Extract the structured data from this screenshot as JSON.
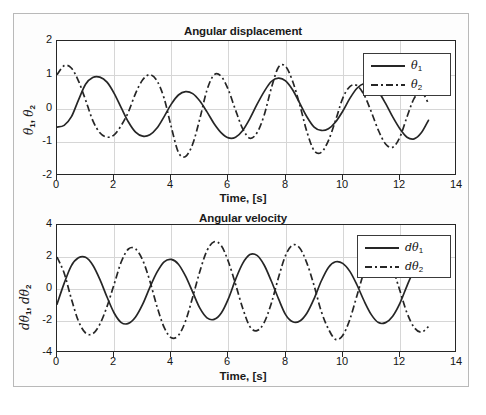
{
  "figure": {
    "width": 486,
    "height": 415,
    "background": "#ffffff",
    "frame_color": "#b9b9b9"
  },
  "style": {
    "line_color": "#262626",
    "grid_color": "#d6d6d6",
    "axis_color": "#262626",
    "text_color": "#151515"
  },
  "subplots": [
    {
      "name": "angular-displacement",
      "title": "Angular displacement",
      "xlabel": "Time, [s]",
      "ylabel_parts": {
        "a": "θ",
        "a_sub": "1",
        "sep": ", ",
        "b": "θ",
        "b_sub": "2"
      },
      "xticks": [
        "0",
        "2",
        "4",
        "6",
        "8",
        "10",
        "12",
        "14"
      ],
      "yticks": [
        "2",
        "1",
        "0",
        "-1",
        "-2"
      ],
      "legend": [
        {
          "label_base": "θ",
          "label_sub": "1",
          "style": "solid"
        },
        {
          "label_base": "θ",
          "label_sub": "2",
          "style": "dashdot"
        }
      ]
    },
    {
      "name": "angular-velocity",
      "title": "Angular velocity",
      "xlabel": "Time, [s]",
      "ylabel_parts": {
        "a": "dθ",
        "a_sub": "1",
        "sep": ", ",
        "b": "dθ",
        "b_sub": "2"
      },
      "xticks": [
        "0",
        "2",
        "4",
        "6",
        "8",
        "10",
        "12",
        "14"
      ],
      "yticks": [
        "4",
        "2",
        "0",
        "-2",
        "-4"
      ],
      "legend": [
        {
          "label_base": "dθ",
          "label_sub": "1",
          "style": "solid"
        },
        {
          "label_base": "dθ",
          "label_sub": "2",
          "style": "dashdot"
        }
      ]
    }
  ],
  "chart_data": [
    {
      "type": "line",
      "title": "Angular displacement",
      "xlabel": "Time, [s]",
      "ylabel": "theta_1, theta_2",
      "xlim": [
        0,
        14
      ],
      "ylim": [
        -2,
        2
      ],
      "xticks": [
        0,
        2,
        4,
        6,
        8,
        10,
        12,
        14
      ],
      "yticks": [
        -2,
        -1,
        0,
        1,
        2
      ],
      "grid": true,
      "legend_position": "top-right",
      "data_extent_x": [
        0,
        13
      ],
      "model": "coupled double pendulum, beating normal modes",
      "series": [
        {
          "name": "theta_1",
          "style": "solid",
          "color": "#262626",
          "description": "slow-envelope beating oscillation starting near -0.55 rad",
          "x": [
            0,
            0.25,
            0.5,
            0.75,
            1,
            1.25,
            1.5,
            1.75,
            2,
            2.25,
            2.5,
            2.75,
            3,
            3.25,
            3.5,
            3.75,
            4,
            4.25,
            4.5,
            4.75,
            5,
            5.25,
            5.5,
            5.75,
            6,
            6.25,
            6.5,
            6.75,
            7,
            7.25,
            7.5,
            7.75,
            8,
            8.25,
            8.5,
            8.75,
            9,
            9.25,
            9.5,
            9.75,
            10,
            10.25,
            10.5,
            10.75,
            11,
            11.25,
            11.5,
            11.75,
            12,
            12.25,
            12.5,
            12.75,
            13
          ],
          "y": [
            -0.55,
            -0.5,
            -0.25,
            0.25,
            0.72,
            0.92,
            0.93,
            0.78,
            0.45,
            0.02,
            -0.4,
            -0.7,
            -0.82,
            -0.78,
            -0.58,
            -0.24,
            0.13,
            0.4,
            0.5,
            0.44,
            0.22,
            -0.1,
            -0.45,
            -0.72,
            -0.87,
            -0.85,
            -0.65,
            -0.3,
            0.12,
            0.5,
            0.8,
            0.9,
            0.82,
            0.55,
            0.15,
            -0.25,
            -0.55,
            -0.65,
            -0.6,
            -0.4,
            -0.08,
            0.3,
            0.6,
            0.74,
            0.7,
            0.5,
            0.15,
            -0.25,
            -0.6,
            -0.85,
            -0.9,
            -0.72,
            -0.35
          ]
        },
        {
          "name": "theta_2",
          "style": "dashdot",
          "color": "#262626",
          "description": "anti-phase beating oscillation starting near 1.0 rad",
          "x": [
            0,
            0.25,
            0.5,
            0.75,
            1,
            1.25,
            1.5,
            1.75,
            2,
            2.25,
            2.5,
            2.75,
            3,
            3.25,
            3.5,
            3.75,
            4,
            4.25,
            4.5,
            4.75,
            5,
            5.25,
            5.5,
            5.75,
            6,
            6.25,
            6.5,
            6.75,
            7,
            7.25,
            7.5,
            7.75,
            8,
            8.25,
            8.5,
            8.75,
            9,
            9.25,
            9.5,
            9.75,
            10,
            10.25,
            10.5,
            10.75,
            11,
            11.25,
            11.5,
            11.75,
            12,
            12.25,
            12.5,
            12.75,
            13
          ],
          "y": [
            1.0,
            1.27,
            1.2,
            0.82,
            0.25,
            -0.35,
            -0.72,
            -0.85,
            -0.78,
            -0.5,
            -0.1,
            0.45,
            0.85,
            1.0,
            0.82,
            0.3,
            -0.55,
            -1.3,
            -1.42,
            -1.05,
            -0.3,
            0.55,
            1.0,
            0.95,
            0.55,
            -0.05,
            -0.6,
            -0.88,
            -0.72,
            -0.2,
            0.6,
            1.22,
            1.25,
            0.8,
            0.1,
            -0.7,
            -1.25,
            -1.3,
            -0.95,
            -0.35,
            0.3,
            0.65,
            0.68,
            0.4,
            -0.1,
            -0.65,
            -1.05,
            -1.15,
            -0.85,
            -0.25,
            0.3,
            0.5,
            0.15
          ]
        }
      ]
    },
    {
      "type": "line",
      "title": "Angular velocity",
      "xlabel": "Time, [s]",
      "ylabel": "dtheta_1, dtheta_2",
      "xlim": [
        0,
        14
      ],
      "ylim": [
        -4,
        4
      ],
      "xticks": [
        0,
        2,
        4,
        6,
        8,
        10,
        12,
        14
      ],
      "yticks": [
        -4,
        -2,
        0,
        2,
        4
      ],
      "grid": true,
      "legend_position": "top-right",
      "data_extent_x": [
        0,
        13
      ],
      "model": "time derivative of the angular displacements",
      "series": [
        {
          "name": "dtheta_1",
          "style": "solid",
          "color": "#262626",
          "description": "derivative of theta_1, amplitude around 2",
          "x": [
            0,
            0.25,
            0.5,
            0.75,
            1,
            1.25,
            1.5,
            1.75,
            2,
            2.25,
            2.5,
            2.75,
            3,
            3.25,
            3.5,
            3.75,
            4,
            4.25,
            4.5,
            4.75,
            5,
            5.25,
            5.5,
            5.75,
            6,
            6.25,
            6.5,
            6.75,
            7,
            7.25,
            7.5,
            7.75,
            8,
            8.25,
            8.5,
            8.75,
            9,
            9.25,
            9.5,
            9.75,
            10,
            10.25,
            10.5,
            10.75,
            11,
            11.25,
            11.5,
            11.75,
            12,
            12.25,
            12.5,
            12.75,
            13
          ],
          "y": [
            -0.95,
            0.35,
            1.45,
            1.95,
            1.98,
            1.5,
            0.6,
            -0.5,
            -1.5,
            -2.1,
            -2.15,
            -1.75,
            -0.95,
            0.1,
            1.05,
            1.7,
            1.85,
            1.55,
            0.8,
            -0.2,
            -1.2,
            -1.8,
            -1.9,
            -1.5,
            -0.6,
            0.6,
            1.6,
            2.15,
            2.1,
            1.5,
            0.5,
            -0.6,
            -1.6,
            -2.05,
            -2.0,
            -1.5,
            -0.6,
            0.5,
            1.35,
            1.7,
            1.6,
            1.1,
            0.25,
            -0.75,
            -1.6,
            -2.1,
            -2.1,
            -1.7,
            -0.9,
            0.2,
            1.2,
            1.85,
            2.05
          ]
        },
        {
          "name": "dtheta_2",
          "style": "dashdot",
          "color": "#262626",
          "description": "derivative of theta_2, amplitude up to ~3",
          "x": [
            0,
            0.25,
            0.5,
            0.75,
            1,
            1.25,
            1.5,
            1.75,
            2,
            2.25,
            2.5,
            2.75,
            3,
            3.25,
            3.5,
            3.75,
            4,
            4.25,
            4.5,
            4.75,
            5,
            5.25,
            5.5,
            5.75,
            6,
            6.25,
            6.5,
            6.75,
            7,
            7.25,
            7.5,
            7.75,
            8,
            8.25,
            8.5,
            8.75,
            9,
            9.25,
            9.5,
            9.75,
            10,
            10.25,
            10.5,
            10.75,
            11,
            11.25,
            11.5,
            11.75,
            12,
            12.25,
            12.5,
            12.75,
            13
          ],
          "y": [
            2.0,
            1.0,
            -0.6,
            -2.0,
            -2.75,
            -2.8,
            -2.2,
            -1.1,
            0.3,
            1.7,
            2.5,
            2.5,
            1.8,
            0.5,
            -1.1,
            -2.4,
            -3.05,
            -2.9,
            -2.0,
            -0.5,
            1.1,
            2.4,
            2.95,
            2.7,
            1.7,
            0.3,
            -1.2,
            -2.35,
            -2.6,
            -2.1,
            -0.9,
            0.7,
            2.1,
            2.75,
            2.55,
            1.6,
            0.2,
            -1.4,
            -2.5,
            -3.15,
            -2.9,
            -1.9,
            -0.4,
            1.1,
            2.3,
            2.7,
            2.35,
            1.3,
            -0.1,
            -1.5,
            -2.4,
            -2.7,
            -2.35
          ]
        }
      ]
    }
  ]
}
